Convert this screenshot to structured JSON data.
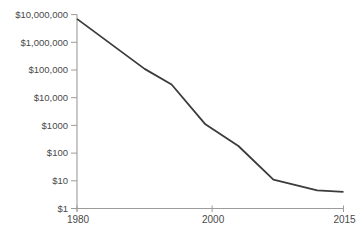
{
  "chart_data": {
    "type": "line",
    "title": "",
    "xlabel": "",
    "ylabel": "",
    "y_scale": "log",
    "ylim": [
      1,
      10000000
    ],
    "grid": false,
    "legend": "none",
    "colors": {
      "line": "#3b3b3b",
      "axis": "#9c9c9c",
      "tick": "#9c9c9c",
      "label": "#4a4a4a",
      "background": "#ffffff"
    },
    "y_ticks": [
      {
        "label": "$10,000,000",
        "value": 10000000
      },
      {
        "label": "$1,000,000",
        "value": 1000000
      },
      {
        "label": "$100,000",
        "value": 100000
      },
      {
        "label": "$10,000",
        "value": 10000
      },
      {
        "label": "$1000",
        "value": 1000
      },
      {
        "label": "$100",
        "value": 100
      },
      {
        "label": "$10",
        "value": 10
      },
      {
        "label": "$1",
        "value": 1
      }
    ],
    "x_ticks": [
      {
        "label": "1980",
        "year": 1980,
        "frac": 0.0
      },
      {
        "label": "2000",
        "year": 2000,
        "frac": 0.507
      },
      {
        "label": "2015",
        "year": 2015,
        "frac": 1.0
      }
    ],
    "series": [
      {
        "name": "price",
        "points": [
          {
            "year": 1980,
            "value": 7000000
          },
          {
            "year": 1990,
            "value": 110000
          },
          {
            "year": 1994,
            "value": 30000
          },
          {
            "year": 1999,
            "value": 1100
          },
          {
            "year": 2003,
            "value": 180
          },
          {
            "year": 2007,
            "value": 11
          },
          {
            "year": 2012,
            "value": 4.5
          },
          {
            "year": 2015,
            "value": 4
          }
        ]
      }
    ]
  }
}
